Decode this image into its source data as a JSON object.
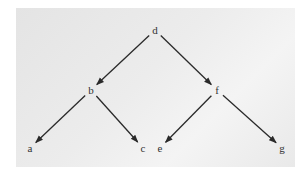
{
  "diagram": {
    "type": "binary-tree",
    "nodes": [
      {
        "id": "d",
        "label": "d",
        "x": 155,
        "y": 30
      },
      {
        "id": "b",
        "label": "b",
        "x": 91,
        "y": 90
      },
      {
        "id": "f",
        "label": "f",
        "x": 217,
        "y": 90
      },
      {
        "id": "a",
        "label": "a",
        "x": 30,
        "y": 148
      },
      {
        "id": "c",
        "label": "c",
        "x": 143,
        "y": 148
      },
      {
        "id": "e",
        "label": "e",
        "x": 160,
        "y": 148
      },
      {
        "id": "g",
        "label": "g",
        "x": 282,
        "y": 148
      }
    ],
    "edges": [
      {
        "from": "d",
        "to": "b"
      },
      {
        "from": "d",
        "to": "f"
      },
      {
        "from": "b",
        "to": "a"
      },
      {
        "from": "b",
        "to": "c"
      },
      {
        "from": "f",
        "to": "e"
      },
      {
        "from": "f",
        "to": "g"
      }
    ],
    "colors": {
      "panel": "#ebebeb",
      "edge": "#2a2a2a",
      "label": "#333333"
    }
  }
}
